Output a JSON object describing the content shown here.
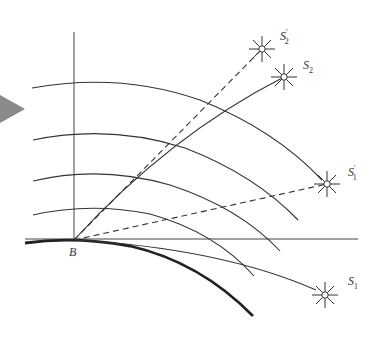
{
  "diagram": {
    "observer": {
      "label": "B"
    },
    "stars": [
      {
        "id": "S1",
        "label": "S",
        "sub": "1",
        "prime": "",
        "kind": "true-position"
      },
      {
        "id": "S1prime",
        "label": "S",
        "sub": "1",
        "prime": "′",
        "kind": "apparent-position"
      },
      {
        "id": "S2",
        "label": "S",
        "sub": "2",
        "prime": "",
        "kind": "true-position"
      },
      {
        "id": "S2prime",
        "label": "S",
        "sub": "2",
        "prime": "′",
        "kind": "apparent-position"
      }
    ],
    "layers_count": 4,
    "colors": {
      "line": "#333333",
      "earth": "#222222",
      "arrow": "#8a8a8a"
    }
  }
}
